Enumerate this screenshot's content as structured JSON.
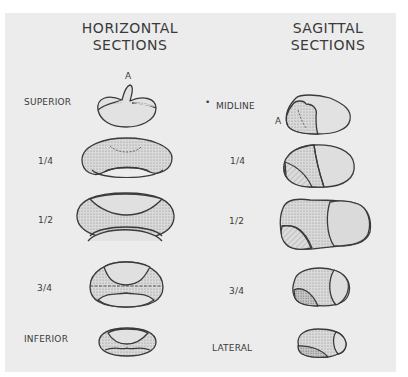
{
  "headings": {
    "horizontal": [
      "HORIZONTAL",
      "SECTIONS"
    ],
    "sagittal": [
      "SAGITTAL",
      "SECTIONS"
    ]
  },
  "horizontal_sections": [
    {
      "label": "SUPERIOR",
      "marker": "A"
    },
    {
      "label": "1/4"
    },
    {
      "label": "1/2"
    },
    {
      "label": "3/4"
    },
    {
      "label": "INFERIOR"
    }
  ],
  "sagittal_sections": [
    {
      "label": "MIDLINE",
      "marker": "A",
      "bullet": "•"
    },
    {
      "label": "1/4"
    },
    {
      "label": "1/2"
    },
    {
      "label": "3/4"
    },
    {
      "label": "LATERAL"
    }
  ],
  "colors": {
    "background": "#ececec",
    "outline": "#3a3a3a",
    "stipple_fill": "#d2d2d2",
    "light_fill": "#dcdcdc"
  }
}
